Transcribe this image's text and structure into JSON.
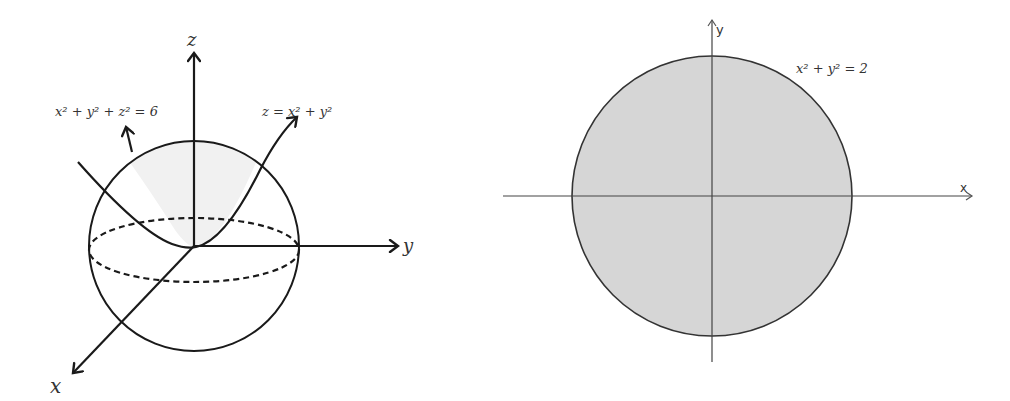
{
  "left_figure": {
    "title": "sphere-and-paraboloid",
    "axes": {
      "z_label": "z",
      "y_label": "y",
      "x_label": "x"
    },
    "annotations": {
      "sphere_equation_lhs": "x",
      "sphere_equation": "x² + y² + z² = 6",
      "paraboloid_equation": "z = x² + y²"
    }
  },
  "right_figure": {
    "title": "projected-disk",
    "axes": {
      "x_label": "x",
      "y_label": "y"
    },
    "annotations": {
      "circle_equation": "x² + y² = 2"
    },
    "fill_color": "#d6d6d6"
  },
  "colors": {
    "stroke": "#1a1a1a",
    "cap_fill": "#f2f2f2",
    "disk_fill": "#d6d6d6"
  }
}
